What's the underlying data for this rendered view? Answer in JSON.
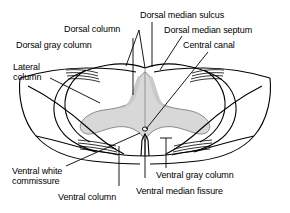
{
  "figure": {
    "background_color": "#ffffff",
    "line_color": "#000000",
    "gray_matter_fill": "#d8d8d8",
    "gray_matter_stroke": "#808080"
  },
  "labels": {
    "dorsal_column": "Dorsal column",
    "dorsal_gray_column": "Dorsal gray column",
    "lateral_column_line1": "Lateral",
    "lateral_column_line2": "column",
    "dorsal_median_sulcus": "Dorsal median sulcus",
    "dorsal_median_septum": "Dorsal median septum",
    "central_canal": "Central canal",
    "ventral_white_commissure_line1": "Ventral white",
    "ventral_white_commissure_line2": "commissure",
    "ventral_column": "Ventral column",
    "ventral_gray_column": "Ventral gray column",
    "ventral_median_fissure": "Ventral median fissure"
  }
}
